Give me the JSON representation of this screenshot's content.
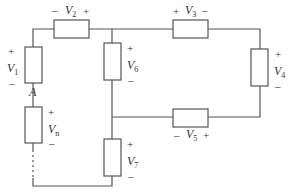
{
  "diagram": {
    "type": "circuit",
    "node_label": "A",
    "elements": [
      {
        "id": "V1",
        "symbol": "V",
        "subscript": "1",
        "plus": "+",
        "minus": "–"
      },
      {
        "id": "V2",
        "symbol": "V",
        "subscript": "2",
        "plus": "+",
        "minus": "–"
      },
      {
        "id": "V3",
        "symbol": "V",
        "subscript": "3",
        "plus": "+",
        "minus": "–"
      },
      {
        "id": "V4",
        "symbol": "V",
        "subscript": "4",
        "plus": "+",
        "minus": "–"
      },
      {
        "id": "V5",
        "symbol": "V",
        "subscript": "5",
        "plus": "+",
        "minus": "–"
      },
      {
        "id": "V6",
        "symbol": "V",
        "subscript": "6",
        "plus": "+",
        "minus": "–"
      },
      {
        "id": "V7",
        "symbol": "V",
        "subscript": "7",
        "plus": "+",
        "minus": "–"
      },
      {
        "id": "Vn",
        "symbol": "V",
        "subscript": "n",
        "plus": "+",
        "minus": "–"
      }
    ]
  }
}
